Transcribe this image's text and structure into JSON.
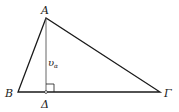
{
  "figure": {
    "type": "triangle-with-altitude",
    "vertices": {
      "A": {
        "label": "A",
        "x": 46,
        "y": 18
      },
      "B": {
        "label": "B",
        "x": 18,
        "y": 92
      },
      "G": {
        "label": "Γ",
        "x": 160,
        "y": 92
      }
    },
    "foot": {
      "label": "Δ",
      "x": 46,
      "y": 92
    },
    "altitude_label": {
      "main": "υ",
      "sub": "α"
    },
    "right_angle_marker": true,
    "colors": {
      "stroke": "#1a1a1a",
      "altitude": "#555555",
      "background": "#ffffff"
    }
  }
}
